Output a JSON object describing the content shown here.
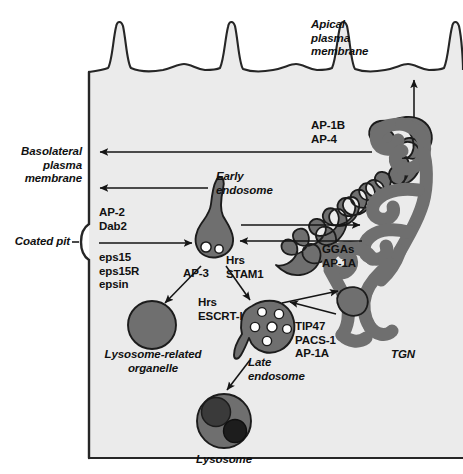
{
  "figure": {
    "type": "cell-trafficking-diagram",
    "colors": {
      "cytoplasm": "#ebebeb",
      "organelle_fill": "#6f6f6f",
      "organelle_stroke": "#1c1c1c",
      "vesicle_lumen": "#ffffff",
      "membrane_line": "#262626",
      "arrow": "#151515",
      "lysosome_inner_dark": "#3a3a3a",
      "lysosome_inner_darkest": "#1d1d1d",
      "page_background": "#ffffff"
    }
  },
  "labels": {
    "apical_membrane": "Apical\nplasma\nmembrane",
    "basolateral_membrane": "Basolateral\nplasma\nmembrane",
    "coated_pit": "Coated pit",
    "early_endosome": "Early\nendosome",
    "late_endosome": "Late\nendosome",
    "lysosome": "Lysosome",
    "lysosome_related_organelle": "Lysosome-related\norganelle",
    "tgn": "TGN"
  },
  "adaptors": {
    "coated_pit_upper": "AP-2\nDab2",
    "coated_pit_lower": "eps15\neps15R\nepsin",
    "tgn_to_basolateral": "AP-1B\nAP-4",
    "endosome_tgn": "GGAs\nAP-1A",
    "early_to_lro": "AP-3",
    "early_to_late": "Hrs\nSTAM1",
    "late_sorting": "Hrs\nESCRT-I",
    "late_to_tgn": "TIP47\nPACS-1\nAP-1A"
  },
  "organelles": [
    {
      "name": "early-endosome",
      "shape": "flask-with-tubule",
      "internal_vesicles": 2
    },
    {
      "name": "late-endosome",
      "shape": "multivesicular-body",
      "internal_vesicles": 6
    },
    {
      "name": "lysosome",
      "shape": "circle-with-two-inclusions",
      "inclusions": 2
    },
    {
      "name": "lysosome-related-organelle",
      "shape": "circle",
      "inclusions": 0
    },
    {
      "name": "tgn",
      "shape": "branched-tubular-network"
    }
  ],
  "arrows": [
    {
      "from": "coated-pit",
      "to": "early-endosome",
      "label": "AP-2 Dab2 / eps15 eps15R epsin"
    },
    {
      "from": "early-endosome",
      "to": "basolateral-membrane",
      "label": ""
    },
    {
      "from": "tgn",
      "to": "basolateral-membrane",
      "label": "AP-1B AP-4"
    },
    {
      "from": "tgn",
      "to": "apical-membrane",
      "label": ""
    },
    {
      "from": "early-endosome",
      "to": "tgn",
      "label": "GGAs AP-1A"
    },
    {
      "from": "tgn",
      "to": "early-endosome",
      "label": "GGAs AP-1A"
    },
    {
      "from": "early-endosome",
      "to": "lysosome-related-organelle",
      "label": "AP-3"
    },
    {
      "from": "early-endosome",
      "to": "late-endosome",
      "label": "Hrs STAM1 / Hrs ESCRT-I"
    },
    {
      "from": "late-endosome",
      "to": "tgn-vesicle",
      "label": "TIP47 PACS-1 AP-1A"
    },
    {
      "from": "tgn-vesicle",
      "to": "late-endosome",
      "label": "TIP47 PACS-1 AP-1A"
    },
    {
      "from": "late-endosome",
      "to": "lysosome",
      "label": ""
    }
  ]
}
